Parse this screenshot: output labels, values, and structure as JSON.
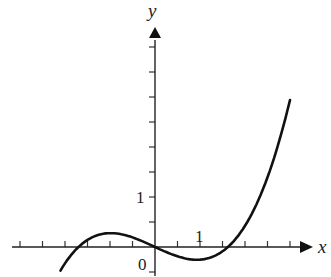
{
  "chart_data": {
    "type": "line",
    "title": "",
    "xlabel": "x",
    "ylabel": "y",
    "origin_label": "0",
    "x_tick_label": "1",
    "y_tick_label": "1",
    "x_tick_step": 0.5,
    "y_tick_step": 0.5,
    "xlim": [
      -3.0,
      3.5
    ],
    "ylim": [
      -0.5,
      4.0
    ],
    "grid": false,
    "legend": null,
    "series": [
      {
        "name": "f(x) ≈ 0.151·x(x+1.7)(x−1.62)",
        "x": [
          -2.1,
          -1.7,
          -1.3,
          -0.95,
          -0.5,
          0,
          0.5,
          1.0,
          1.3,
          1.62,
          2.0,
          2.5,
          3.0
        ],
        "y": [
          -0.47,
          0.0,
          0.2,
          0.28,
          0.2,
          0.0,
          -0.17,
          -0.25,
          -0.18,
          0.0,
          0.42,
          1.42,
          2.94
        ]
      }
    ]
  }
}
